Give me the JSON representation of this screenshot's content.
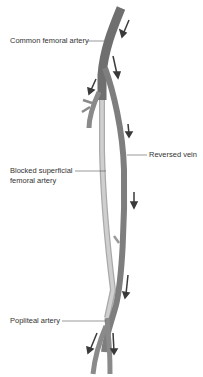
{
  "diagram": {
    "labels": {
      "common_femoral": "Common femoral artery",
      "reversed_vein": "Reversed vein",
      "blocked_sfa_line1": "Blocked superficial",
      "blocked_sfa_line2": "femoral artery",
      "popliteal": "Popliteal artery"
    },
    "colors": {
      "artery": "#7a7a7a",
      "vein": "#8c8c8c",
      "blocked": "#bdbdbd",
      "arrow": "#3a3a3a",
      "leader": "#555555"
    }
  }
}
